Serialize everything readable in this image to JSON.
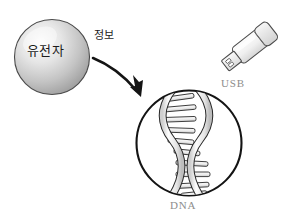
{
  "diagram": {
    "background_color": "#ffffff",
    "nodes": {
      "gene_sphere": {
        "label": "유전자",
        "shape": "sphere",
        "center_x": 52,
        "center_y": 57,
        "radius": 38,
        "fill_light": "#f2f2f2",
        "fill_dark": "#9e9e9e",
        "outline_color": "#3a3a3a"
      },
      "arrow": {
        "label": "정보",
        "shape": "curved-arrow",
        "color": "#141414",
        "from_x": 92,
        "from_y": 60,
        "to_x": 141,
        "to_y": 97
      },
      "dna_circle": {
        "label": "DNA",
        "shape": "circle",
        "center_x": 189,
        "center_y": 143,
        "radius": 53,
        "fill": "#ffffff",
        "outline_color": "#141414",
        "strand_fill": "#ededed",
        "strand_outline": "#2b2b2b",
        "rung_count": 10
      },
      "usb_drive": {
        "label": "USB",
        "shape": "usb-flash-drive",
        "center_x": 252,
        "center_y": 45,
        "rotation_deg": -38,
        "body_fill": "#f0f0f0",
        "cap_fill": "#e2e2e2",
        "connector_fill": "#e8e8e8",
        "outline_color": "#4a4a4a"
      }
    },
    "label_colors": {
      "korean_text": "#1c1c1c",
      "latin_text": "#8d8d8d"
    }
  }
}
